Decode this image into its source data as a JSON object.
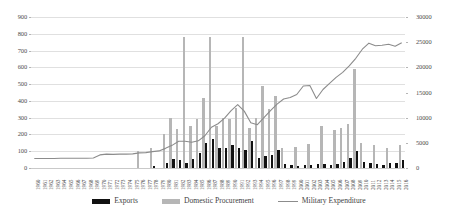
{
  "chart_data": {
    "type": "bar",
    "title": "",
    "subtitle": "",
    "xlabel": "",
    "ylabel": "",
    "y2label": "",
    "grid": true,
    "legend_position": "bottom",
    "ylim": [
      0,
      900
    ],
    "y2lim": [
      0,
      30000
    ],
    "yticks": [
      "0",
      "100",
      "200",
      "300",
      "400",
      "500",
      "600",
      "700",
      "800",
      "900"
    ],
    "y2ticks": [
      "0",
      "5000",
      "10000",
      "15000",
      "20000",
      "25000",
      "30000"
    ],
    "categories": [
      "1960",
      "1961",
      "1962",
      "1963",
      "1964",
      "1965",
      "1966",
      "1967",
      "1968",
      "1969",
      "1970",
      "1971",
      "1972",
      "1973",
      "1974",
      "1975",
      "1976",
      "1977",
      "1978",
      "1979",
      "1980",
      "1981",
      "1982",
      "1983",
      "1984",
      "1985",
      "1986",
      "1987",
      "1988",
      "1989",
      "1990",
      "1991",
      "1992",
      "1993",
      "1994",
      "1995",
      "1996",
      "1997",
      "1998",
      "1999",
      "2000",
      "2001",
      "2002",
      "2003",
      "2004",
      "2005",
      "2006",
      "2007",
      "2008",
      "2009",
      "2010",
      "2011",
      "2012",
      "2013",
      "2014",
      "2015",
      "2016"
    ],
    "series": [
      {
        "name": "Exports",
        "type": "bar",
        "color": "#111111",
        "axis": "left",
        "values": [
          0,
          0,
          0,
          0,
          0,
          0,
          0,
          0,
          0,
          0,
          0,
          0,
          0,
          0,
          0,
          0,
          0,
          0,
          12,
          0,
          28,
          55,
          48,
          30,
          55,
          90,
          150,
          170,
          120,
          120,
          140,
          120,
          110,
          160,
          60,
          70,
          80,
          105,
          25,
          20,
          10,
          18,
          18,
          22,
          22,
          18,
          24,
          35,
          60,
          100,
          35,
          30,
          22,
          18,
          32,
          30,
          48
        ]
      },
      {
        "name": "Domestic Procurement",
        "type": "bar",
        "color": "#b6b6b6",
        "axis": "left",
        "values": [
          0,
          0,
          0,
          0,
          0,
          0,
          0,
          0,
          0,
          0,
          0,
          0,
          0,
          0,
          0,
          0,
          100,
          0,
          120,
          0,
          200,
          300,
          230,
          780,
          250,
          290,
          420,
          780,
          250,
          300,
          290,
          360,
          780,
          240,
          300,
          490,
          350,
          430,
          120,
          0,
          125,
          0,
          145,
          0,
          250,
          0,
          225,
          240,
          265,
          590,
          150,
          0,
          140,
          0,
          120,
          0,
          140
        ]
      },
      {
        "name": "Military Expenditure",
        "type": "line",
        "color": "#8c8c8c",
        "axis": "right",
        "values": [
          1900,
          1900,
          1900,
          1900,
          1950,
          1950,
          1950,
          1950,
          1950,
          2000,
          2600,
          2750,
          2700,
          2750,
          2750,
          2800,
          3000,
          3050,
          3250,
          3400,
          3900,
          4500,
          5300,
          5300,
          5100,
          5400,
          6400,
          8100,
          8800,
          9900,
          11400,
          12600,
          11300,
          9000,
          8600,
          10000,
          11400,
          12700,
          13700,
          14000,
          14600,
          16300,
          16400,
          13800,
          15600,
          16800,
          18000,
          19000,
          20300,
          21800,
          23600,
          24800,
          24300,
          24400,
          24600,
          24200,
          24900
        ]
      }
    ],
    "legend": [
      {
        "label": "Exports",
        "swatch": "bar-black"
      },
      {
        "label": "Domestic Procurement",
        "swatch": "bar-gray"
      },
      {
        "label": "Military Expenditure",
        "swatch": "line-gray"
      }
    ]
  }
}
